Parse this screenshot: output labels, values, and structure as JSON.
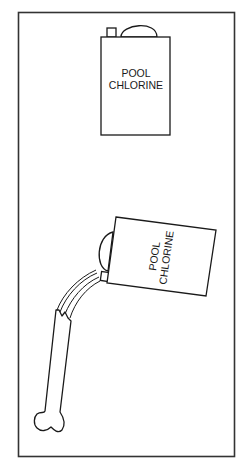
{
  "figure": {
    "frame_color": "#333333",
    "stroke_color": "#1a1a1a",
    "background": "#ffffff",
    "upright_can": {
      "label_line1": "POOL",
      "label_line2": "CHLORINE"
    },
    "tilted_can": {
      "label_line1": "POOL",
      "label_line2": "CHLORINE",
      "rotation_deg": -82
    },
    "bone": {
      "description": "bone being dissolved by poured chlorine"
    },
    "caption": ""
  }
}
